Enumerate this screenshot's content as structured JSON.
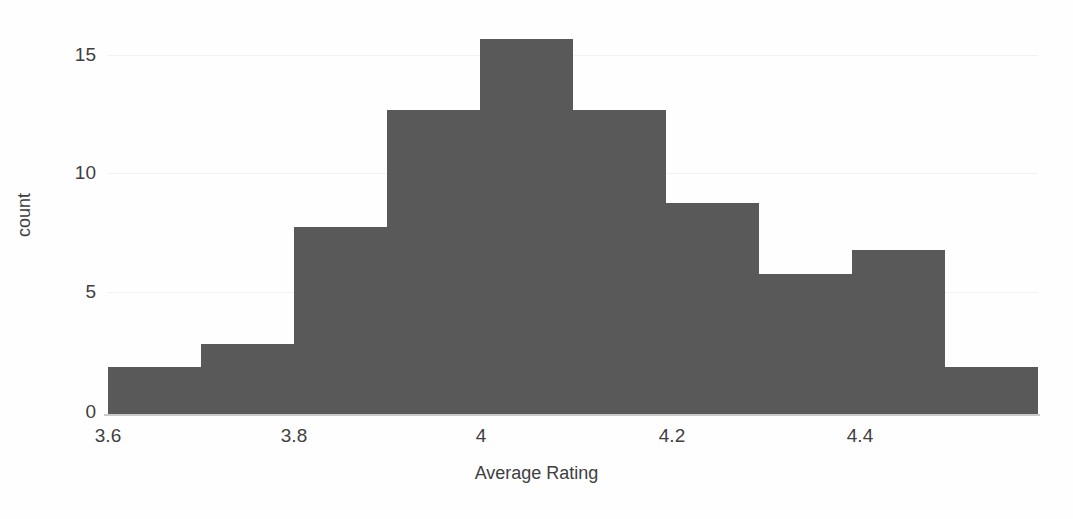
{
  "chart_data": {
    "type": "bar",
    "title": "",
    "subtitle": "",
    "xlabel": "Average Rating",
    "ylabel": "count",
    "grid": true,
    "legend": null,
    "xlim": [
      3.6,
      4.53
    ],
    "ylim": [
      0,
      17
    ],
    "bin_width": 0.093,
    "x_ticks": [
      "3.6",
      "3.8",
      "4",
      "4.2",
      "4.4"
    ],
    "x_tick_values": [
      3.6,
      3.8,
      4.0,
      4.2,
      4.4
    ],
    "y_ticks": [
      "0",
      "5",
      "10",
      "15"
    ],
    "y_tick_values": [
      0,
      5,
      10,
      15
    ],
    "categories": [
      "3.60-3.69",
      "3.69-3.79",
      "3.79-3.88",
      "3.88-3.97",
      "3.97-4.07",
      "4.07-4.16",
      "4.16-4.25",
      "4.25-4.34",
      "4.34-4.44",
      "4.44-4.53"
    ],
    "values": [
      2,
      3,
      8,
      13,
      16,
      13,
      9,
      6,
      7,
      2
    ],
    "bar_color": "#595959",
    "gridline_color": "#f1f1f1",
    "axis_color": "#c9c9c9",
    "text_color": "#3f3f3f",
    "background_color": "#fefefe"
  },
  "axis": {
    "y_label": "count",
    "x_label": "Average Rating"
  }
}
